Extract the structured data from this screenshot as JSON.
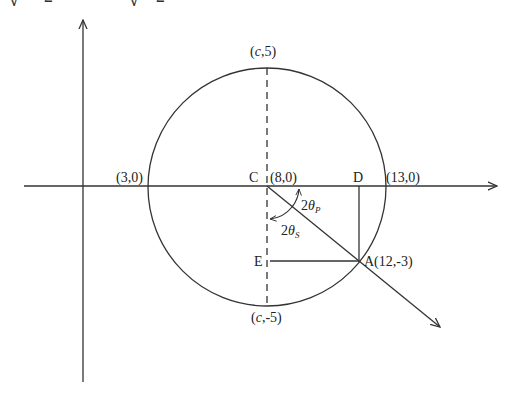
{
  "header_fragment": {
    "glyphs": [
      "√",
      "2",
      "√",
      "2"
    ]
  },
  "diagram": {
    "type": "mohr-circle",
    "labels": {
      "top": {
        "pre": "(",
        "var": "c",
        "post": ",5)"
      },
      "bottom": {
        "pre": "(",
        "var": "c",
        "post": ",-5)"
      },
      "left_intercept": "(3,0)",
      "center_letter": "C",
      "center_coord": "(8,0)",
      "d_letter": "D",
      "right_intercept": "(13,0)",
      "e_letter": "E",
      "point_a": "A(12,-3)",
      "angle_p": {
        "num": "2",
        "sym": "θ",
        "sub": "P"
      },
      "angle_s": {
        "num": "2",
        "sym": "θ",
        "sub": "S"
      }
    },
    "points": {
      "center": [
        8,
        0
      ],
      "left": [
        3,
        0
      ],
      "right": [
        13,
        0
      ],
      "top": [
        "c",
        5
      ],
      "bottom": [
        "c",
        -5
      ],
      "A": [
        12,
        -3
      ]
    },
    "colors": {
      "stroke": "#333333",
      "text": "#222222"
    }
  }
}
